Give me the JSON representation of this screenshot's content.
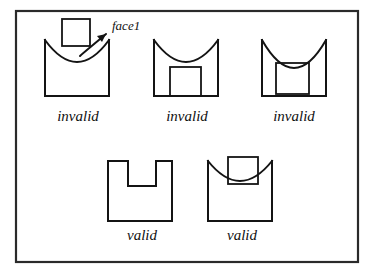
{
  "figure": {
    "background_color": "#ffffff",
    "ink_color": "#141414",
    "frame": {
      "x": 16,
      "y": 11,
      "width": 342,
      "height": 251
    }
  },
  "annotation": {
    "label": "face1",
    "x": 112,
    "y": 30,
    "font_size": 13,
    "arrow": {
      "from_x": 80,
      "from_y": 56,
      "to_x": 106,
      "to_y": 34
    }
  },
  "rows": [
    {
      "name": "invalid-row",
      "items": [
        {
          "id": "shape-1",
          "caption": "invalid",
          "caption_x": 78,
          "caption_y": 121,
          "body": {
            "x": 45,
            "y": 40,
            "width": 64,
            "height": 56
          },
          "arc": {
            "depth": 22
          },
          "inner": {
            "x": 62,
            "y": 19,
            "width": 28,
            "height": 27
          },
          "inner_role": "overlapping-square-above-arc"
        },
        {
          "id": "shape-2",
          "caption": "invalid",
          "caption_x": 187,
          "caption_y": 121,
          "body": {
            "x": 154,
            "y": 40,
            "width": 64,
            "height": 56
          },
          "arc": {
            "depth": 22
          },
          "inner": {
            "x": 170,
            "y": 67,
            "width": 31,
            "height": 29
          },
          "inner_role": "square-touching-bottom-edge"
        },
        {
          "id": "shape-3",
          "caption": "invalid",
          "caption_x": 294,
          "caption_y": 121,
          "body": {
            "x": 262,
            "y": 40,
            "width": 64,
            "height": 56
          },
          "arc": {
            "depth": 28
          },
          "inner": {
            "x": 276,
            "y": 63,
            "width": 33,
            "height": 31
          },
          "inner_role": "square-tangent-to-arc"
        }
      ]
    },
    {
      "name": "valid-row",
      "items": [
        {
          "id": "shape-4",
          "caption": "valid",
          "caption_x": 142,
          "caption_y": 240,
          "body": {
            "x": 108,
            "y": 161,
            "width": 64,
            "height": 60
          },
          "arc": {
            "depth": 0
          },
          "inner": {
            "x": 128,
            "y": 161,
            "width": 28,
            "height": 25
          },
          "inner_role": "notch-cut-in-top-edge"
        },
        {
          "id": "shape-5",
          "caption": "valid",
          "caption_x": 242,
          "caption_y": 240,
          "body": {
            "x": 208,
            "y": 161,
            "width": 64,
            "height": 60
          },
          "arc": {
            "depth": 20
          },
          "inner": {
            "x": 228,
            "y": 157,
            "width": 30,
            "height": 27
          },
          "inner_role": "rectangle-straddling-arc"
        }
      ]
    }
  ],
  "captions": {
    "invalid": "invalid",
    "valid": "valid",
    "font_size": 15
  }
}
